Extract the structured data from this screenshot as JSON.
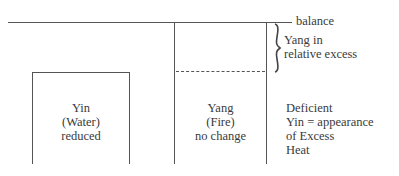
{
  "diagram": {
    "balance_label": "balance",
    "excess_label_line1": "Yang in",
    "excess_label_line2": "relative excess",
    "yin_box": {
      "line1": "Yin",
      "line2": "(Water)",
      "line3": "reduced"
    },
    "yang_box": {
      "line1": "Yang",
      "line2": "(Fire)",
      "line3": "no change"
    },
    "result": {
      "line1": "Deficient",
      "line2": "Yin = appearance",
      "line3": "of Excess",
      "line4": "Heat"
    },
    "colors": {
      "line": "#555555",
      "text": "#3a3a3a",
      "background": "#ffffff"
    }
  }
}
